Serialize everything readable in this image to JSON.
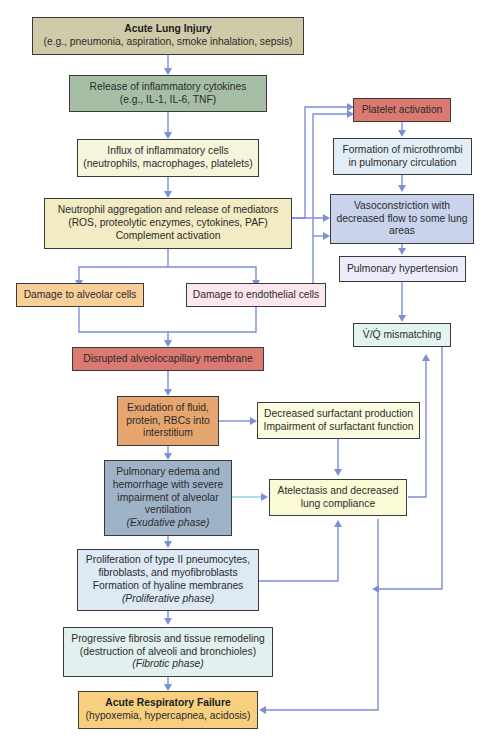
{
  "diagram": {
    "colors": {
      "arrow": "#7d8fd6",
      "border": "#3a3a3a"
    },
    "nodes": {
      "acute_lung_injury": {
        "title": "Acute Lung Injury",
        "detail": "(e.g., pneumonia, aspiration, smoke inhalation, sepsis)",
        "color": "#cfcaa7"
      },
      "cytokines": {
        "line1": "Release of inflammatory cytokines",
        "line2": "(e.g., IL-1, IL-6, TNF)",
        "color": "#a6bfa4"
      },
      "influx": {
        "line1": "Influx of inflammatory cells",
        "line2": "(neutrophils, macrophages, platelets)",
        "color": "#f7f4dc"
      },
      "neutrophil": {
        "line1": "Neutrophil aggregation and release of mediators",
        "line2": "(ROS, proteolytic enzymes, cytokines, PAF)",
        "line3": "Complement activation",
        "color": "#f2ebc4"
      },
      "alveolar_damage": {
        "line1": "Damage to alveolar cells",
        "color": "#f9cf98"
      },
      "endothelial_damage": {
        "line1": "Damage to endothelial cells",
        "color": "#fbe6ee"
      },
      "disrupted_membrane": {
        "line1": "Disrupted alveolocapillary membrane",
        "color": "#dc7a72"
      },
      "exudation": {
        "line1": "Exudation of fluid,",
        "line2": "protein, RBCs into",
        "line3": "interstitium",
        "color": "#e6a46e"
      },
      "surfactant": {
        "line1": "Decreased surfactant production",
        "line2": "Impairment of surfactant function",
        "color": "#fbfbe0"
      },
      "edema": {
        "line1": "Pulmonary edema and",
        "line2": "hemorrhage with severe",
        "line3": "impairment of alveolar",
        "line4": "ventilation",
        "phase": "(Exudative phase)",
        "color": "#9fb3c8"
      },
      "atelectasis": {
        "line1": "Atelectasis and decreased",
        "line2": "lung compliance",
        "color": "#fbfad6"
      },
      "proliferation": {
        "line1": "Proliferation of type II pneumocytes,",
        "line2": "fibroblasts, and myofibroblasts",
        "line3": "Formation of hyaline membranes",
        "phase": "(Proliferative phase)",
        "color": "#dde9f5"
      },
      "fibrosis": {
        "line1": "Progressive fibrosis and tissue remodeling",
        "line2": "(destruction of alveoli and bronchioles)",
        "phase": "(Fibrotic phase)",
        "color": "#e2f1ef"
      },
      "respiratory_failure": {
        "title": "Acute Respiratory Failure",
        "detail": "(hypoxemia, hypercapnea, acidosis)",
        "color": "#f7cf7f"
      },
      "platelet": {
        "line1": "Platelet activation",
        "color": "#dc7a72"
      },
      "microthrombi": {
        "line1": "Formation of microthrombi",
        "line2": "in pulmonary circulation",
        "color": "#e2eef7"
      },
      "vasoconstriction": {
        "line1": "Vasoconstriction with",
        "line2": "decreased flow to some lung",
        "line3": "areas",
        "color": "#c9d3ee"
      },
      "pulm_hypertension": {
        "line1": "Pulmonary hypertension",
        "color": "#ecebf9"
      },
      "vq_mismatch": {
        "line1": "V̇/Q̇ mismatching",
        "color": "#e2f4ef"
      }
    }
  }
}
